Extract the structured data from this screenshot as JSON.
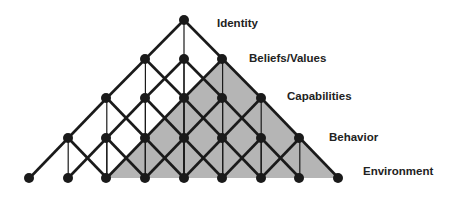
{
  "diagram": {
    "levels": [
      {
        "label": "Identity",
        "x": 217,
        "y": 17
      },
      {
        "label": "Beliefs/Values",
        "x": 249,
        "y": 52
      },
      {
        "label": "Capabilities",
        "x": 287,
        "y": 90
      },
      {
        "label": "Behavior",
        "x": 329,
        "y": 131
      },
      {
        "label": "Environment",
        "x": 363,
        "y": 165
      }
    ],
    "colors": {
      "line": "#1a1a1a",
      "node": "#1a1a1a",
      "shade": "#b5b5b5"
    },
    "shaded_region": [
      [
        222,
        59
      ],
      [
        106,
        178
      ],
      [
        338,
        178
      ]
    ]
  }
}
